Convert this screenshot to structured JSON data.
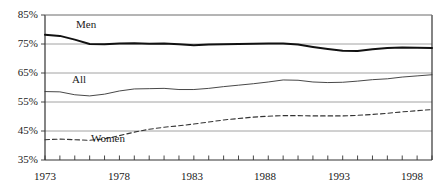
{
  "chart_data": {
    "type": "line",
    "title": "",
    "subtitle": "",
    "xlabel": "",
    "ylabel": "",
    "xlim": [
      1973,
      1999
    ],
    "ylim": [
      35,
      85
    ],
    "grid": true,
    "gridlines_y": [
      85,
      75,
      65,
      55,
      45
    ],
    "ytick_labels": [
      "85%",
      "75%",
      "65%",
      "55%",
      "45%",
      "35%"
    ],
    "ytick_values": [
      85,
      75,
      65,
      55,
      45,
      35
    ],
    "xtick_labels": [
      "1973",
      "1978",
      "1983",
      "1988",
      "1993",
      "1998"
    ],
    "xtick_values": [
      1973,
      1978,
      1983,
      1988,
      1993,
      1998
    ],
    "xtick_minor_step": 1,
    "legend": "inline-labels",
    "x": [
      1973,
      1974,
      1975,
      1976,
      1977,
      1978,
      1979,
      1980,
      1981,
      1982,
      1983,
      1984,
      1985,
      1986,
      1987,
      1988,
      1989,
      1990,
      1991,
      1992,
      1993,
      1994,
      1995,
      1996,
      1997,
      1998,
      1999
    ],
    "series": [
      {
        "name": "Men",
        "style": "solid-thick",
        "color": "#111111",
        "values": [
          78.2,
          77.8,
          76.5,
          75.0,
          74.9,
          75.2,
          75.3,
          75.1,
          75.2,
          74.9,
          74.6,
          74.8,
          74.9,
          75.0,
          75.1,
          75.2,
          75.2,
          74.8,
          74.0,
          73.3,
          72.7,
          72.6,
          73.2,
          73.6,
          73.8,
          73.7,
          73.6
        ]
      },
      {
        "name": "All",
        "style": "solid-thin",
        "color": "#333333",
        "values": [
          58.6,
          58.5,
          57.5,
          57.1,
          57.7,
          58.8,
          59.5,
          59.6,
          59.7,
          59.3,
          59.3,
          59.7,
          60.3,
          60.8,
          61.3,
          61.9,
          62.6,
          62.5,
          61.9,
          61.7,
          61.8,
          62.2,
          62.7,
          63.0,
          63.6,
          64.0,
          64.4
        ]
      },
      {
        "name": "Women",
        "style": "dashed",
        "color": "#333333",
        "values": [
          42.0,
          42.2,
          42.0,
          41.8,
          42.3,
          43.4,
          44.6,
          45.6,
          46.3,
          46.8,
          47.4,
          48.1,
          48.8,
          49.3,
          49.8,
          50.1,
          50.3,
          50.3,
          50.2,
          50.2,
          50.2,
          50.4,
          50.7,
          51.1,
          51.6,
          52.0,
          52.4
        ]
      }
    ],
    "series_labels": [
      {
        "name": "Men",
        "x_px": 76,
        "y_px": 24
      },
      {
        "name": "All",
        "x_px": 72,
        "y_px": 79
      },
      {
        "name": "Women",
        "x_px": 91,
        "y_px": 138
      }
    ]
  }
}
